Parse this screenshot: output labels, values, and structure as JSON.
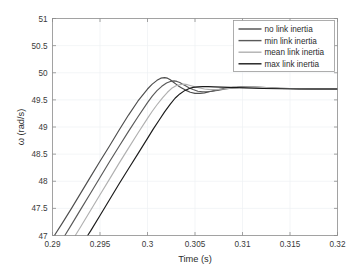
{
  "chart_data": {
    "type": "line",
    "title": "",
    "xlabel": "Time (s)",
    "ylabel": "ω (rad/s)",
    "xlim": [
      0.29,
      0.32
    ],
    "ylim": [
      47,
      51
    ],
    "xticks": [
      0.29,
      0.295,
      0.3,
      0.305,
      0.31,
      0.315,
      0.32
    ],
    "xticklabels": [
      "0.29",
      "0.295",
      "0.3",
      "0.305",
      "0.31",
      "0.315",
      "0.32"
    ],
    "yticks": [
      47,
      47.5,
      48,
      48.5,
      49,
      49.5,
      50,
      50.5,
      51
    ],
    "yticklabels": [
      "47",
      "47.5",
      "48",
      "48.5",
      "49",
      "49.5",
      "50",
      "50.5",
      "51"
    ],
    "grid": true,
    "legend_position": "top-right",
    "series": [
      {
        "name": "no link inertia",
        "color": "#4d4d4d",
        "x": [
          0.2902,
          0.291,
          0.292,
          0.293,
          0.294,
          0.295,
          0.296,
          0.297,
          0.298,
          0.299,
          0.3,
          0.3005,
          0.301,
          0.3014,
          0.3018,
          0.3021,
          0.3024,
          0.3027,
          0.303,
          0.3033,
          0.3036,
          0.304,
          0.3045,
          0.305,
          0.3055,
          0.306,
          0.3065,
          0.307,
          0.3075,
          0.308,
          0.309,
          0.31,
          0.311,
          0.312,
          0.314,
          0.316,
          0.318,
          0.32
        ],
        "y": [
          47.0,
          47.22,
          47.5,
          47.79,
          48.08,
          48.37,
          48.65,
          48.94,
          49.22,
          49.48,
          49.7,
          49.79,
          49.86,
          49.9,
          49.91,
          49.9,
          49.87,
          49.83,
          49.79,
          49.75,
          49.72,
          49.68,
          49.64,
          49.62,
          49.62,
          49.63,
          49.65,
          49.67,
          49.69,
          49.71,
          49.73,
          49.74,
          49.73,
          49.72,
          49.71,
          49.705,
          49.7,
          49.7
        ]
      },
      {
        "name": "min link inertia",
        "color": "#595959",
        "x": [
          0.2913,
          0.292,
          0.293,
          0.294,
          0.295,
          0.296,
          0.297,
          0.298,
          0.299,
          0.3,
          0.3005,
          0.301,
          0.3015,
          0.302,
          0.3024,
          0.3028,
          0.3031,
          0.3034,
          0.3037,
          0.304,
          0.3044,
          0.3048,
          0.3053,
          0.3058,
          0.3063,
          0.3068,
          0.3075,
          0.3082,
          0.309,
          0.31,
          0.311,
          0.312,
          0.314,
          0.316,
          0.318,
          0.32
        ],
        "y": [
          47.0,
          47.2,
          47.49,
          47.78,
          48.07,
          48.36,
          48.64,
          48.92,
          49.19,
          49.45,
          49.57,
          49.67,
          49.75,
          49.81,
          49.84,
          49.85,
          49.84,
          49.82,
          49.79,
          49.76,
          49.72,
          49.69,
          49.66,
          49.65,
          49.65,
          49.66,
          49.68,
          49.7,
          49.72,
          49.735,
          49.74,
          49.73,
          49.715,
          49.705,
          49.7,
          49.7
        ]
      },
      {
        "name": "mean link inertia",
        "color": "#b0b0b0",
        "x": [
          0.2924,
          0.293,
          0.294,
          0.295,
          0.296,
          0.297,
          0.298,
          0.299,
          0.3,
          0.3005,
          0.301,
          0.3016,
          0.3021,
          0.3026,
          0.303,
          0.3034,
          0.3038,
          0.3042,
          0.3046,
          0.305,
          0.3055,
          0.306,
          0.3066,
          0.3072,
          0.308,
          0.309,
          0.31,
          0.311,
          0.312,
          0.314,
          0.316,
          0.318,
          0.32
        ],
        "y": [
          47.0,
          47.17,
          47.46,
          47.75,
          48.04,
          48.33,
          48.61,
          48.89,
          49.16,
          49.29,
          49.41,
          49.54,
          49.64,
          49.72,
          49.76,
          49.78,
          49.79,
          49.78,
          49.76,
          49.74,
          49.72,
          49.7,
          49.69,
          49.69,
          49.7,
          49.72,
          49.735,
          49.74,
          49.73,
          49.715,
          49.705,
          49.7,
          49.7
        ]
      },
      {
        "name": "max link inertia",
        "color": "#1a1a1a",
        "x": [
          0.2937,
          0.294,
          0.295,
          0.296,
          0.297,
          0.298,
          0.299,
          0.3,
          0.3006,
          0.3012,
          0.3018,
          0.3024,
          0.3029,
          0.3034,
          0.3039,
          0.3044,
          0.3048,
          0.3053,
          0.3058,
          0.3064,
          0.307,
          0.3078,
          0.3086,
          0.3094,
          0.3102,
          0.3112,
          0.3122,
          0.314,
          0.316,
          0.318,
          0.32
        ],
        "y": [
          47.0,
          47.08,
          47.37,
          47.66,
          47.95,
          48.23,
          48.51,
          48.79,
          48.96,
          49.12,
          49.28,
          49.42,
          49.53,
          49.61,
          49.67,
          49.71,
          49.73,
          49.74,
          49.745,
          49.745,
          49.74,
          49.735,
          49.73,
          49.725,
          49.72,
          49.715,
          49.71,
          49.705,
          49.7,
          49.7,
          49.7
        ]
      }
    ]
  },
  "legend": {
    "entries": [
      {
        "label": "no link inertia"
      },
      {
        "label": "min link inertia"
      },
      {
        "label": "mean link inertia"
      },
      {
        "label": "max link inertia"
      }
    ]
  }
}
